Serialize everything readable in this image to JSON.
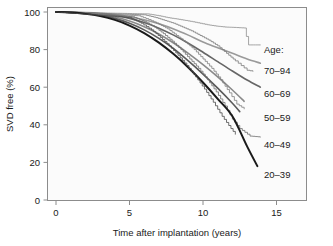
{
  "chart_data": {
    "type": "line",
    "title": "",
    "xlabel": "Time after implantation (years)",
    "ylabel": "SVD free (%)",
    "xlim": [
      -1.2,
      17.5
    ],
    "ylim": [
      0,
      104
    ],
    "xticks": [
      0,
      5,
      10,
      15
    ],
    "yticks": [
      0,
      20,
      40,
      60,
      80,
      100
    ],
    "xtick_labels": [
      "0",
      "5",
      "10",
      "15"
    ],
    "ytick_labels": [
      "0",
      "20",
      "40",
      "60",
      "80",
      "100"
    ],
    "grid": false,
    "legend_position": "right-inside",
    "legend_title": "Age:",
    "series": [
      {
        "name": "70–94",
        "color": "#9a9a9a",
        "style": "smooth-fit",
        "x": [
          0,
          1,
          2,
          3,
          4,
          5,
          6,
          7,
          8,
          9,
          10,
          11,
          12,
          13,
          13.9
        ],
        "values": [
          100,
          99.9,
          99.7,
          99.3,
          98.6,
          97.5,
          95.9,
          93.7,
          91.0,
          87.7,
          84.0,
          81.0,
          78.0,
          75.0,
          72.8
        ]
      },
      {
        "name": "70–94",
        "color": "#8f8f8f",
        "style": "kaplan-meier-step",
        "x": [
          0,
          6.2,
          7.0,
          7.6,
          8.2,
          8.8,
          9.3,
          9.8,
          10.3,
          10.9,
          11.5,
          12.1,
          12.8,
          13.1,
          13.9
        ],
        "values": [
          100,
          99.0,
          98.0,
          97.0,
          96.3,
          95.5,
          94.8,
          94.0,
          93.2,
          92.5,
          92.0,
          91.8,
          91.5,
          82.5,
          82.5
        ]
      },
      {
        "name": "60–69",
        "color": "#666666",
        "style": "smooth-fit",
        "x": [
          0,
          1,
          2,
          3,
          4,
          5,
          6,
          7,
          8,
          9,
          10,
          11,
          12,
          13,
          13.9
        ],
        "values": [
          100,
          99.9,
          99.6,
          99.0,
          98.1,
          96.6,
          94.4,
          91.4,
          87.7,
          83.4,
          78.6,
          73.6,
          68.6,
          63.8,
          60.0
        ]
      },
      {
        "name": "60–69",
        "color": "#7a7a7a",
        "style": "kaplan-meier-step",
        "x": [
          0,
          6.0,
          6.8,
          7.4,
          8.0,
          8.6,
          9.2,
          9.8,
          10.4,
          11.0,
          11.6,
          12.2,
          12.6,
          13.0,
          13.4
        ],
        "values": [
          100,
          98.5,
          97.0,
          95.5,
          94.0,
          92.0,
          90.0,
          87.5,
          85.0,
          82.0,
          78.0,
          74.0,
          71.5,
          69.0,
          68.5
        ]
      },
      {
        "name": "50–59",
        "color": "#8a8a8a",
        "style": "smooth-fit",
        "x": [
          0,
          1,
          2,
          3,
          4,
          5,
          6,
          7,
          8,
          9,
          10,
          11,
          12,
          12.8
        ],
        "values": [
          100,
          99.8,
          99.4,
          98.6,
          97.3,
          95.2,
          92.2,
          88.3,
          83.5,
          78.0,
          72.0,
          65.5,
          58.5,
          52.5
        ]
      },
      {
        "name": "50–59",
        "color": "#7f7f7f",
        "style": "kaplan-meier-step",
        "x": [
          0,
          5.6,
          6.3,
          7.0,
          7.6,
          8.2,
          8.8,
          9.4,
          10.0,
          10.6,
          11.2,
          11.8,
          12.3,
          12.8
        ],
        "values": [
          100,
          98.0,
          96.0,
          93.5,
          91.0,
          87.5,
          84.0,
          80.0,
          75.0,
          70.0,
          64.0,
          57.0,
          51.0,
          48.5
        ]
      },
      {
        "name": "40–49",
        "color": "#5a5a5a",
        "style": "smooth-fit",
        "x": [
          0,
          1,
          2,
          3,
          4,
          5,
          6,
          7,
          8,
          9,
          10,
          11,
          12,
          12.5
        ],
        "values": [
          100,
          99.8,
          99.2,
          98.2,
          96.6,
          94.0,
          90.5,
          86.0,
          80.5,
          74.0,
          67.0,
          59.5,
          51.5,
          47.0
        ]
      },
      {
        "name": "40–49",
        "color": "#6e6e6e",
        "style": "kaplan-meier-step",
        "x": [
          0,
          5.2,
          6.0,
          6.7,
          7.3,
          7.9,
          8.5,
          9.1,
          9.7,
          10.3,
          10.9,
          11.5,
          12.0,
          12.5,
          13.2,
          13.9
        ],
        "values": [
          100,
          97.5,
          95.0,
          92.0,
          88.5,
          84.5,
          80.0,
          75.0,
          70.0,
          64.0,
          57.5,
          50.0,
          43.0,
          38.0,
          34.0,
          33.5
        ]
      },
      {
        "name": "20–39",
        "color": "#1a1a1a",
        "style": "smooth-fit",
        "x": [
          0,
          1,
          2,
          3,
          4,
          5,
          6,
          7,
          8,
          9,
          10,
          11,
          12,
          13,
          13.7
        ],
        "values": [
          100,
          99.7,
          99.0,
          97.8,
          95.8,
          92.8,
          88.8,
          83.7,
          77.6,
          70.5,
          62.5,
          53.8,
          44.5,
          28.5,
          18.0
        ]
      },
      {
        "name": "20–39",
        "color": "#4a4a4a",
        "style": "kaplan-meier-step",
        "x": [
          0,
          5.0,
          5.8,
          6.5,
          7.1,
          7.7,
          8.3,
          8.9,
          9.5,
          10.1,
          10.7,
          11.3,
          11.9,
          12.2
        ],
        "values": [
          100,
          97.0,
          94.0,
          90.5,
          86.5,
          82.0,
          77.0,
          71.5,
          65.5,
          59.0,
          52.0,
          44.5,
          38.0,
          35.0
        ]
      }
    ],
    "legend_entries": [
      {
        "label": "Age:",
        "is_title": true
      },
      {
        "label": "70–94",
        "color": "#9a9a9a"
      },
      {
        "label": "60–69",
        "color": "#666666"
      },
      {
        "label": "50–59",
        "color": "#8a8a8a"
      },
      {
        "label": "40–49",
        "color": "#5a5a5a"
      },
      {
        "label": "20–39",
        "color": "#1a1a1a"
      }
    ],
    "annotations": []
  },
  "axes": {
    "x_label": "Time after implantation (years)",
    "y_label": "SVD free (%)",
    "x_ticks": [
      "0",
      "5",
      "10",
      "15"
    ],
    "y_ticks": [
      "100",
      "80",
      "60",
      "40",
      "20",
      "0"
    ]
  },
  "legend": {
    "title": "Age:",
    "items": [
      "70–94",
      "60–69",
      "50–59",
      "40–49",
      "20–39"
    ]
  },
  "style": {
    "panel_border": "#8c8c8c",
    "background": "#ffffff",
    "text_color": "#1a1a1a"
  }
}
